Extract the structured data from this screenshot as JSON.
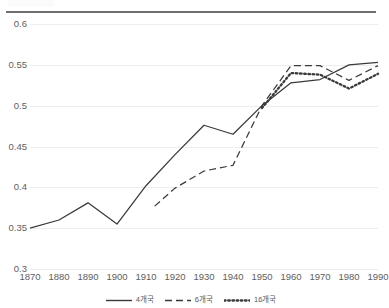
{
  "chart_data": {
    "type": "line",
    "title": "",
    "xlabel": "",
    "ylabel": "",
    "xlim": [
      1870,
      1990
    ],
    "ylim": [
      0.3,
      0.6
    ],
    "grid": true,
    "legend_position": "bottom",
    "x": [
      1870,
      1880,
      1890,
      1900,
      1910,
      1920,
      1930,
      1940,
      1950,
      1960,
      1970,
      1980,
      1990
    ],
    "xticklabels": [
      "1870",
      "1880",
      "1890",
      "1900",
      "1910",
      "1920",
      "1930",
      "1940",
      "1950",
      "1960",
      "1970",
      "1980",
      "1990"
    ],
    "yticks": [
      0.3,
      0.35,
      0.4,
      0.45,
      0.5,
      0.55,
      0.6
    ],
    "yticklabels": [
      "0.3",
      "0.35",
      "0.4",
      "0.45",
      "0.5",
      "0.55",
      "0.6"
    ],
    "series": [
      {
        "name": "4개국",
        "style": "solid",
        "color": "#3a3a3a",
        "x": [
          1870,
          1880,
          1890,
          1900,
          1910,
          1920,
          1930,
          1940,
          1950,
          1960,
          1970,
          1980,
          1990
        ],
        "values": [
          0.35,
          0.36,
          0.381,
          0.355,
          0.402,
          0.44,
          0.476,
          0.465,
          0.5,
          0.528,
          0.532,
          0.55,
          0.553
        ]
      },
      {
        "name": "6개국",
        "style": "dashed",
        "color": "#3a3a3a",
        "x": [
          1913,
          1920,
          1930,
          1940,
          1950,
          1960,
          1970,
          1980,
          1990
        ],
        "values": [
          0.377,
          0.399,
          0.42,
          0.427,
          0.5,
          0.549,
          0.549,
          0.531,
          0.549
        ]
      },
      {
        "name": "16개국",
        "style": "dotted",
        "color": "#3a3a3a",
        "x": [
          1950,
          1960,
          1970,
          1980,
          1990
        ],
        "values": [
          0.497,
          0.54,
          0.538,
          0.521,
          0.539
        ]
      }
    ]
  },
  "legend": {
    "items": [
      {
        "label": "4개국",
        "style": "solid"
      },
      {
        "label": "6개국",
        "style": "dashed"
      },
      {
        "label": "16개국",
        "style": "dotted"
      }
    ]
  }
}
